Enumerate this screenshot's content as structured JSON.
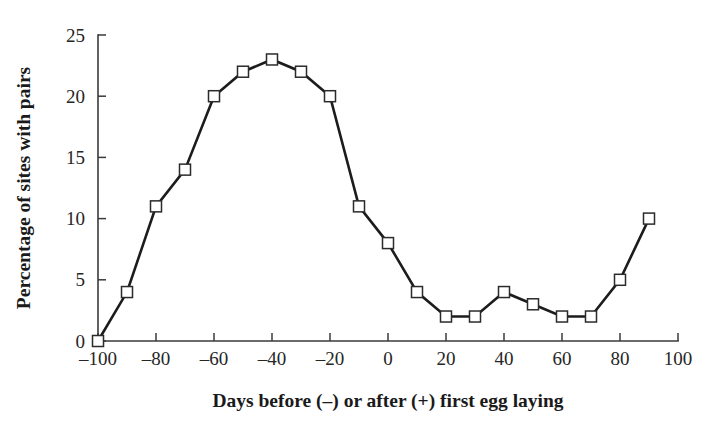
{
  "chart_data": {
    "type": "line",
    "title": "",
    "xlabel": "Days before (–) or after (+) first egg laying",
    "ylabel": "Percentage of sites with pairs",
    "x": [
      -100,
      -90,
      -80,
      -70,
      -60,
      -50,
      -40,
      -30,
      -20,
      -10,
      0,
      10,
      20,
      30,
      40,
      50,
      60,
      70,
      80,
      90
    ],
    "values": [
      0,
      4,
      11,
      14,
      20,
      22,
      23,
      22,
      20,
      11,
      8,
      4,
      2,
      2,
      4,
      3,
      2,
      2,
      5,
      10
    ],
    "series": [
      {
        "name": "Percentage of sites with pairs",
        "values": [
          0,
          4,
          11,
          14,
          20,
          22,
          23,
          22,
          20,
          11,
          8,
          4,
          2,
          2,
          4,
          3,
          2,
          2,
          5,
          10
        ]
      }
    ],
    "xlim": [
      -100,
      100
    ],
    "ylim": [
      0,
      25
    ],
    "xticks": [
      -100,
      -80,
      -60,
      -40,
      -20,
      0,
      20,
      40,
      60,
      80,
      100
    ],
    "xtick_labels": [
      "–100",
      "–80",
      "–60",
      "–40",
      "–20",
      "0",
      "20",
      "40",
      "60",
      "80",
      "100"
    ],
    "yticks": [
      0,
      5,
      10,
      15,
      20,
      25
    ],
    "ytick_labels": [
      "0",
      "5",
      "10",
      "15",
      "20",
      "25"
    ],
    "grid": false,
    "legend": "none",
    "marker": "open-square",
    "line_color": "#1c1c1c",
    "marker_fill": "#ffffff",
    "marker_edge": "#2b2b2b",
    "background": "#ffffff"
  }
}
